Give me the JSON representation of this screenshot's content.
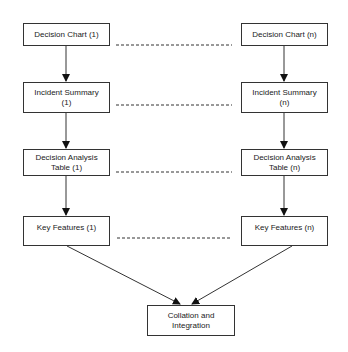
{
  "diagram": {
    "left_column": [
      {
        "line1": "Decision Chart (1)",
        "line2": ""
      },
      {
        "line1": "Incident Summary",
        "line2": "(1)"
      },
      {
        "line1": "Decision Analysis",
        "line2": "Table (1)"
      },
      {
        "line1": "Key Features (1)",
        "line2": ""
      }
    ],
    "right_column": [
      {
        "line1": "Decision Chart (n)",
        "line2": ""
      },
      {
        "line1": "Incident Summary",
        "line2": "(n)"
      },
      {
        "line1": "Decision Analysis",
        "line2": "Table (n)"
      },
      {
        "line1": "Key Features (n)",
        "line2": ""
      }
    ],
    "final": {
      "line1": "Collation and",
      "line2": "Integration"
    },
    "colors": {
      "stroke": "#333333",
      "background": "#ffffff",
      "text": "#222222"
    }
  }
}
